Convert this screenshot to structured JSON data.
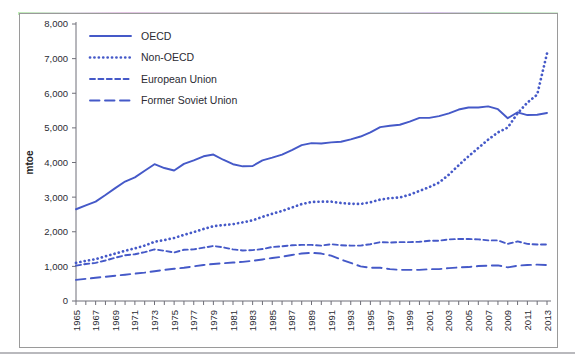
{
  "chart_data": {
    "type": "line",
    "title": "",
    "xlabel": "",
    "ylabel": "mtoe",
    "xlim": [
      1965,
      2013
    ],
    "ylim": [
      0,
      8000
    ],
    "y_ticks": [
      "0",
      "1,000",
      "2,000",
      "3,000",
      "4,000",
      "5,000",
      "6,000",
      "7,000",
      "8,000"
    ],
    "y_tick_values": [
      0,
      1000,
      2000,
      3000,
      4000,
      5000,
      6000,
      7000,
      8000
    ],
    "grid": false,
    "legend_position": "top-left",
    "x": [
      1965,
      1966,
      1967,
      1968,
      1969,
      1970,
      1971,
      1972,
      1973,
      1974,
      1975,
      1976,
      1977,
      1978,
      1979,
      1980,
      1981,
      1982,
      1983,
      1984,
      1985,
      1986,
      1987,
      1988,
      1989,
      1990,
      1991,
      1992,
      1993,
      1994,
      1995,
      1996,
      1997,
      1998,
      1999,
      2000,
      2001,
      2002,
      2003,
      2004,
      2005,
      2006,
      2007,
      2008,
      2009,
      2010,
      2011,
      2012,
      2013
    ],
    "x_tick_labels": [
      "1965",
      "1967",
      "1969",
      "1971",
      "1973",
      "1975",
      "1977",
      "1979",
      "1981",
      "1983",
      "1985",
      "1987",
      "1989",
      "1991",
      "1993",
      "1995",
      "1997",
      "1999",
      "2001",
      "2003",
      "2005",
      "2007",
      "2009",
      "2011",
      "2013"
    ],
    "series": [
      {
        "name": "OECD",
        "style": "solid",
        "color": "#4559c8",
        "values": [
          2650,
          2760,
          2870,
          3060,
          3260,
          3450,
          3570,
          3760,
          3950,
          3840,
          3770,
          3960,
          4060,
          4180,
          4230,
          4080,
          3950,
          3890,
          3900,
          4060,
          4140,
          4230,
          4360,
          4500,
          4560,
          4550,
          4580,
          4600,
          4670,
          4750,
          4870,
          5020,
          5060,
          5090,
          5180,
          5290,
          5290,
          5340,
          5420,
          5530,
          5590,
          5590,
          5620,
          5540,
          5280,
          5450,
          5370,
          5380,
          5430
        ]
      },
      {
        "name": "Non-OECD",
        "style": "dotted",
        "color": "#4559c8",
        "values": [
          1100,
          1160,
          1210,
          1290,
          1370,
          1450,
          1520,
          1600,
          1710,
          1760,
          1820,
          1910,
          1990,
          2080,
          2160,
          2190,
          2220,
          2270,
          2330,
          2430,
          2520,
          2600,
          2700,
          2800,
          2860,
          2870,
          2870,
          2830,
          2810,
          2800,
          2850,
          2930,
          2970,
          2990,
          3070,
          3180,
          3290,
          3420,
          3650,
          3920,
          4180,
          4420,
          4660,
          4870,
          5010,
          5420,
          5730,
          5960,
          7150
        ]
      },
      {
        "name": "European Union",
        "style": "dashed",
        "color": "#4559c8",
        "values": [
          1020,
          1070,
          1100,
          1170,
          1250,
          1320,
          1350,
          1410,
          1490,
          1450,
          1400,
          1480,
          1490,
          1540,
          1590,
          1550,
          1490,
          1460,
          1470,
          1500,
          1560,
          1580,
          1610,
          1620,
          1620,
          1600,
          1640,
          1610,
          1600,
          1600,
          1640,
          1700,
          1690,
          1700,
          1700,
          1710,
          1740,
          1740,
          1780,
          1790,
          1790,
          1780,
          1750,
          1750,
          1650,
          1720,
          1650,
          1630,
          1630
        ]
      },
      {
        "name": "Former Soviet Union",
        "style": "longdash",
        "color": "#4559c8",
        "values": [
          610,
          640,
          670,
          700,
          730,
          760,
          790,
          820,
          860,
          900,
          930,
          960,
          1000,
          1040,
          1070,
          1090,
          1110,
          1130,
          1160,
          1200,
          1240,
          1280,
          1330,
          1370,
          1390,
          1370,
          1310,
          1200,
          1100,
          1000,
          960,
          960,
          920,
          900,
          900,
          900,
          920,
          920,
          950,
          970,
          980,
          1010,
          1020,
          1030,
          970,
          1020,
          1040,
          1050,
          1040
        ]
      }
    ],
    "legend": [
      {
        "label": "OECD",
        "style": "solid"
      },
      {
        "label": "Non-OECD",
        "style": "dotted"
      },
      {
        "label": "European Union",
        "style": "dashed"
      },
      {
        "label": "Former Soviet Union",
        "style": "longdash"
      }
    ],
    "accent_color": "#4559c8",
    "axis_color": "#6f6f78",
    "frame_color": "#9a9a9a"
  }
}
